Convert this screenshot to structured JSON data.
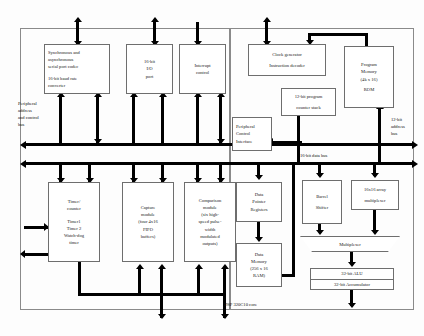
{
  "diagram": {
    "core_label": "DSP 320C10 core",
    "buses": {
      "peripheral_bus_label": [
        "Peripheral",
        "address",
        "and control",
        "bus"
      ],
      "data_bus_label": "16-bit data bus",
      "address_bus_label": [
        "12-bit",
        "address",
        "bus"
      ]
    },
    "blocks": {
      "serial_port": [
        "Synchronous and",
        "asynchronous",
        "serial port codec",
        "",
        "16-bit baud rate",
        "converter"
      ],
      "io_port": [
        "16-bit",
        "I/O",
        "port"
      ],
      "interrupt": [
        "Interrupt",
        "control"
      ],
      "clock_gen": [
        "Clock generator",
        "Instruction decoder"
      ],
      "pc_stack": [
        "12-bit program",
        "counter stack"
      ],
      "program_memory": [
        "Program",
        "Memory",
        "(4k x 16)",
        "ROM"
      ],
      "peripheral_ctrl": [
        "Peripheral",
        "Control",
        "Interface"
      ],
      "timer": [
        "Timer/",
        "counter",
        "",
        "Timer1",
        "Timer 2",
        "Watch-dog",
        "timer"
      ],
      "capture": [
        "Capture",
        "module",
        "(four 4x16",
        "FIFO",
        "buffers)"
      ],
      "comparison": [
        "Comparison",
        "module",
        "(six high-",
        "speed pulse-",
        "width",
        "modulated",
        "outputs)"
      ],
      "data_pointer": [
        "Data",
        "Pointer",
        "Registers"
      ],
      "data_memory": [
        "Data",
        "Memory",
        "(256 x 16",
        "RAM)"
      ],
      "barrel_shifter": [
        "Barrel",
        "Shifter"
      ],
      "array_multiplier": [
        "16x16 array",
        "multiplexer"
      ],
      "multiplexer": [
        "Multiplexer"
      ],
      "alu": "32-bit ALU",
      "accumulator": "32-bit Accumulator"
    }
  }
}
